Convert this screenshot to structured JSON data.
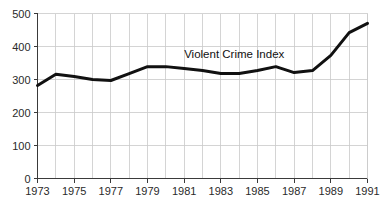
{
  "chart_data": {
    "type": "line",
    "title": "",
    "xlabel": "",
    "ylabel": "",
    "xlim": [
      1973,
      1991
    ],
    "ylim": [
      0,
      500
    ],
    "grid": true,
    "legend_position": "inline-annotation",
    "series_label": "Violent Crime Index",
    "y_ticks": [
      0,
      100,
      200,
      300,
      400,
      500
    ],
    "y_tick_labels": [
      "0",
      "100",
      "200",
      "300",
      "400",
      "500"
    ],
    "x_ticks": [
      1973,
      1974,
      1975,
      1976,
      1977,
      1978,
      1979,
      1980,
      1981,
      1982,
      1983,
      1984,
      1985,
      1986,
      1987,
      1988,
      1989,
      1990,
      1991
    ],
    "x_tick_labels": [
      "1973",
      "",
      "1975",
      "",
      "1977",
      "",
      "1979",
      "",
      "1981",
      "",
      "1983",
      "",
      "1985",
      "",
      "1987",
      "",
      "1989",
      "",
      "1991"
    ],
    "x": [
      1973,
      1974,
      1975,
      1976,
      1977,
      1978,
      1979,
      1980,
      1981,
      1982,
      1983,
      1984,
      1985,
      1986,
      1987,
      1988,
      1989,
      1990,
      1991
    ],
    "series": [
      {
        "name": "Violent Crime Index",
        "color": "#111111",
        "values": [
          282,
          316,
          309,
          300,
          297,
          318,
          339,
          339,
          333,
          327,
          318,
          318,
          327,
          339,
          321,
          327,
          373,
          442,
          470
        ]
      }
    ],
    "annotations": [
      {
        "text": "Violent Crime Index",
        "x": 1981.0,
        "y": 365
      }
    ]
  },
  "colors": {
    "line": "#111111",
    "grid": "#c9c9c9",
    "axis": "#3a3a3a",
    "text": "#2a2a2a",
    "background": "#ffffff"
  }
}
